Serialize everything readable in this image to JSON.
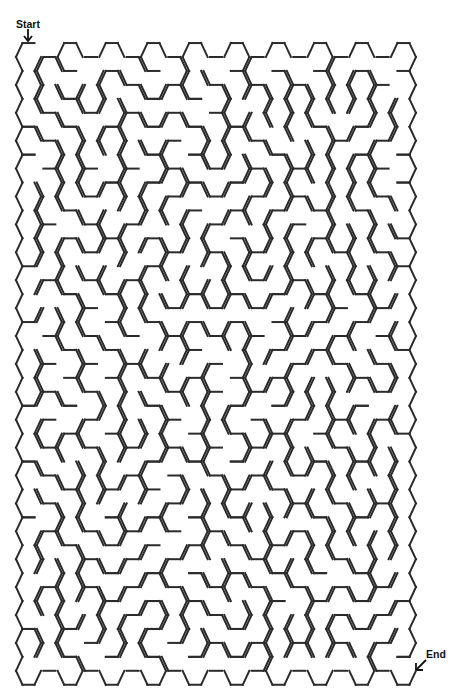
{
  "labels": {
    "start": "Start",
    "end": "End"
  },
  "colors": {
    "wall": "#2b2b2b",
    "background": "#ffffff",
    "label": "#111111"
  },
  "grid": {
    "columns": 19,
    "rows_even_column": 23,
    "rows_odd_column": 22,
    "origin_x": 28.5,
    "origin_y": 57,
    "col_step": 20.83,
    "row_step": 27.9,
    "radius_x": 12.5,
    "half_height": 13.95,
    "top_half_edge": 6
  },
  "start": {
    "col": 0,
    "row": 0,
    "open_edge": "top-right"
  },
  "end": {
    "col": 18,
    "row": 22,
    "open_edge": "top-right"
  },
  "generator": {
    "algorithm": "randomized-dfs",
    "seed": 20240611
  }
}
